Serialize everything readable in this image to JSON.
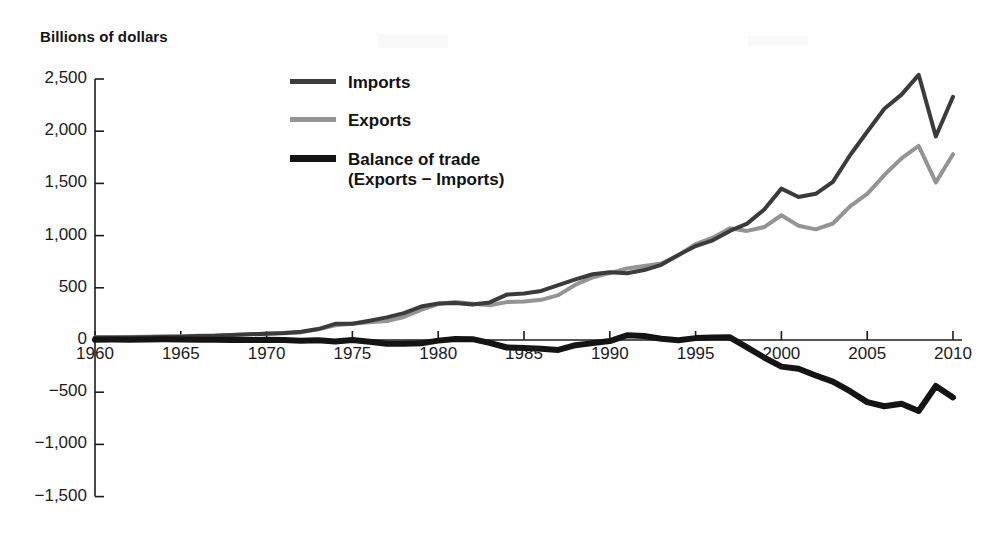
{
  "figure": {
    "axis_title": "Billions of dollars",
    "background_color": "#fefefe"
  },
  "legend": {
    "position": "inside-top-left",
    "items": [
      {
        "label": "Imports",
        "sublabel": "",
        "color": "#3b3b3b",
        "swatch": "line-thin"
      },
      {
        "label": "Exports",
        "sublabel": "",
        "color": "#949494",
        "swatch": "line-thin"
      },
      {
        "label": "Balance of trade",
        "sublabel": "(Exports − Imports)",
        "color": "#141414",
        "swatch": "line-thick"
      }
    ]
  },
  "axes": {
    "y_ticks": [
      "2,500",
      "2,000",
      "1,500",
      "1,000",
      "500",
      "0",
      "−500",
      "−1,000",
      "−1,500"
    ],
    "y_tick_values": [
      2500,
      2000,
      1500,
      1000,
      500,
      0,
      -500,
      -1000,
      -1500
    ],
    "x_ticks": [
      "1960",
      "1965",
      "1970",
      "1975",
      "1980",
      "1985",
      "1990",
      "1995",
      "2000",
      "2005",
      "2010"
    ],
    "x_tick_values": [
      1960,
      1965,
      1970,
      1975,
      1980,
      1985,
      1990,
      1995,
      2000,
      2005,
      2010
    ]
  },
  "chart_data": {
    "type": "line",
    "title": "",
    "subtitle": "",
    "xlabel": "",
    "ylabel": "Billions of dollars",
    "xlim": [
      1960,
      2010
    ],
    "ylim": [
      -1500,
      2500
    ],
    "grid": false,
    "legend_position": "inside-top-left",
    "x": [
      1960,
      1961,
      1962,
      1963,
      1964,
      1965,
      1966,
      1967,
      1968,
      1969,
      1970,
      1971,
      1972,
      1973,
      1974,
      1975,
      1976,
      1977,
      1978,
      1979,
      1980,
      1981,
      1982,
      1983,
      1984,
      1985,
      1986,
      1987,
      1988,
      1989,
      1990,
      1991,
      1992,
      1993,
      1994,
      1995,
      1996,
      1997,
      1998,
      1999,
      2000,
      2001,
      2002,
      2003,
      2004,
      2005,
      2006,
      2007,
      2008,
      2009,
      2010
    ],
    "series": [
      {
        "name": "Imports",
        "color": "#3b3b3b",
        "width": 4,
        "values": [
          23,
          23,
          25,
          26,
          29,
          32,
          38,
          41,
          49,
          54,
          60,
          66,
          79,
          105,
          155,
          155,
          185,
          217,
          257,
          320,
          350,
          355,
          340,
          360,
          435,
          445,
          470,
          525,
          580,
          630,
          650,
          640,
          670,
          720,
          815,
          900,
          955,
          1045,
          1115,
          1250,
          1450,
          1370,
          1400,
          1515,
          1770,
          1995,
          2215,
          2350,
          2540,
          1950,
          2330
        ]
      },
      {
        "name": "Exports",
        "color": "#949494",
        "width": 4,
        "values": [
          26,
          26,
          28,
          30,
          35,
          37,
          41,
          44,
          49,
          54,
          62,
          65,
          73,
          102,
          141,
          156,
          169,
          182,
          221,
          288,
          344,
          364,
          348,
          332,
          363,
          368,
          385,
          430,
          530,
          600,
          640,
          685,
          709,
          732,
          812,
          918,
          980,
          1071,
          1045,
          1082,
          1195,
          1095,
          1060,
          1116,
          1280,
          1400,
          1580,
          1740,
          1860,
          1510,
          1780
        ]
      },
      {
        "name": "Balance of trade",
        "color": "#141414",
        "width": 6,
        "values": [
          3,
          4,
          3,
          4,
          6,
          5,
          3,
          3,
          0,
          0,
          2,
          -1,
          -6,
          -3,
          -14,
          1,
          -16,
          -35,
          -36,
          -32,
          -6,
          9,
          8,
          -28,
          -72,
          -77,
          -85,
          -95,
          -50,
          -30,
          -10,
          45,
          39,
          12,
          -3,
          18,
          25,
          26,
          -70,
          -168,
          -255,
          -275,
          -340,
          -399,
          -490,
          -595,
          -635,
          -610,
          -680,
          -440,
          -550
        ]
      }
    ]
  }
}
